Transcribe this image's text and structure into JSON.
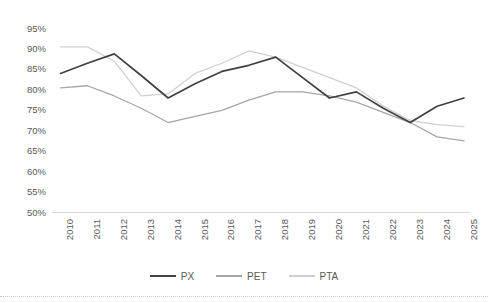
{
  "chart_data": {
    "type": "line",
    "title": "",
    "xlabel": "",
    "ylabel": "",
    "categories": [
      "2010",
      "2011",
      "2012",
      "2013",
      "2014",
      "2015",
      "2016",
      "2017",
      "2018",
      "2019",
      "2020",
      "2021",
      "2022",
      "2023",
      "2024",
      "2025"
    ],
    "x": [
      2010,
      2011,
      2012,
      2013,
      2014,
      2015,
      2016,
      2017,
      2018,
      2019,
      2020,
      2021,
      2022,
      2023,
      2024,
      2025
    ],
    "series": [
      {
        "name": "PX",
        "color": "#404040",
        "values": [
          84.0,
          86.5,
          88.8,
          83.5,
          78.0,
          81.5,
          84.5,
          86.0,
          88.0,
          83.0,
          78.0,
          79.5,
          75.5,
          72.0,
          76.0,
          78.0
        ]
      },
      {
        "name": "PET",
        "color": "#a6a6a6",
        "values": [
          80.5,
          81.0,
          78.5,
          75.5,
          72.0,
          73.5,
          75.0,
          77.5,
          79.5,
          79.5,
          78.5,
          77.0,
          74.5,
          72.0,
          68.5,
          67.5
        ]
      },
      {
        "name": "PTA",
        "color": "#d0d0d0",
        "values": [
          90.5,
          90.5,
          87.0,
          78.5,
          79.0,
          84.0,
          86.5,
          89.5,
          88.0,
          85.5,
          83.0,
          80.5,
          76.0,
          72.5,
          71.5,
          71.0
        ]
      }
    ],
    "ylim": [
      50,
      95
    ],
    "ytick_values": [
      95,
      90,
      85,
      80,
      75,
      70,
      65,
      60,
      55,
      50
    ],
    "ytick_labels": [
      "95%",
      "90%",
      "85%",
      "80%",
      "75%",
      "70%",
      "65%",
      "60%",
      "55%",
      "50%"
    ],
    "grid": false,
    "baseline_axis": true,
    "legend": {
      "position": "bottom",
      "entries": [
        {
          "label": "PX",
          "color": "#404040"
        },
        {
          "label": "PET",
          "color": "#a6a6a6"
        },
        {
          "label": "PTA",
          "color": "#d0d0d0"
        }
      ]
    }
  },
  "colors": {
    "px": "#404040",
    "pet": "#a6a6a6",
    "pta": "#d0d0d0",
    "axis": "#d9d9d9",
    "text": "#595959",
    "background": "#ffffff",
    "bottom_rule": "#c8c8c8"
  }
}
